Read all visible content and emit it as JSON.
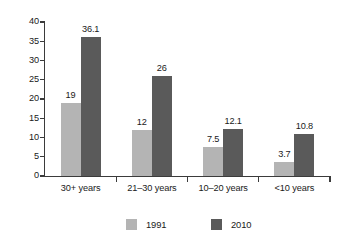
{
  "chart_data": {
    "type": "bar",
    "title": "",
    "subtitle": "",
    "xlabel": "",
    "ylabel": "",
    "categories": [
      "30+ years",
      "21–30 years",
      "10–20 years",
      "<10 years"
    ],
    "series": [
      {
        "name": "1991",
        "color": "#b4b4b4",
        "values": [
          19,
          12,
          7.5,
          3.7
        ],
        "labels": [
          "19",
          "12",
          "7.5",
          "3.7"
        ]
      },
      {
        "name": "2010",
        "color": "#5a5a5a",
        "values": [
          36.1,
          26,
          12.1,
          10.8
        ],
        "labels": [
          "36.1",
          "26",
          "12.1",
          "10.8"
        ]
      }
    ],
    "ylim": [
      0,
      40
    ],
    "yticks": [
      0,
      5,
      10,
      15,
      20,
      25,
      30,
      35,
      40
    ],
    "ytick_labels": [
      "0",
      "5",
      "10",
      "15",
      "20",
      "25",
      "30",
      "35",
      "40"
    ],
    "grid": false,
    "legend_position": "bottom",
    "legend_entries": [
      "1991",
      "2010"
    ],
    "annotations": [],
    "axis_color": "#3b3b3b",
    "background_color": "#ffffff"
  }
}
